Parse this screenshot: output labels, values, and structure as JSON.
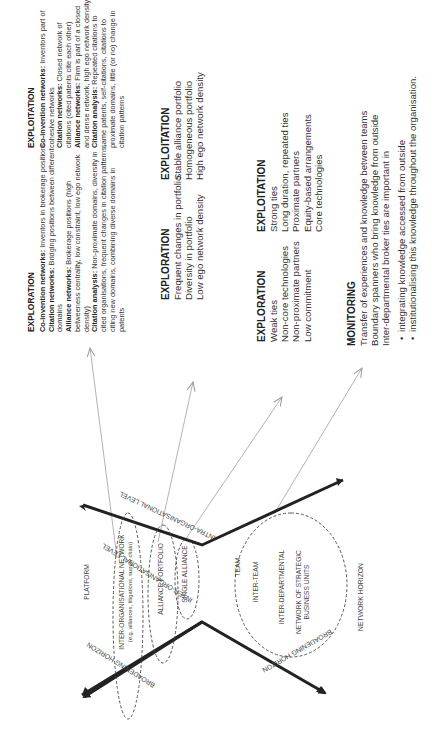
{
  "exploration_detailed": {
    "heading": "EXPLORATION",
    "items": [
      {
        "term": "Co-invention networks:",
        "text": " Inventors in brokerage positions"
      },
      {
        "term": "Citation networks:",
        "text": " Bridging positions between different domains"
      },
      {
        "term": "Alliance networks:",
        "text": " Brokerage positions (high betweeness centrality, low constraint, low ego network density)"
      },
      {
        "term": "Citation analysis:",
        "text": " Non-proximate domains, diversity in cited organisations, frequent changes in citation patterns, citing new domains, combining diverse domains in patents"
      }
    ]
  },
  "exploitation_detailed": {
    "heading": "EXPLOITATION",
    "items": [
      {
        "term": "Co-invention networks:",
        "text": " Inventors part of cohesive networks"
      },
      {
        "term": "Citation networks:",
        "text": " Closed network of citations (cited patents cite each other)"
      },
      {
        "term": "Alliance networks:",
        "text": " Firm is part of a closed and dense network, high ego network density"
      },
      {
        "term": "Citation analysis:",
        "text": " Repeated citations to same patents, self-citations, citations to proximate domains, little (or no) change in citation patterns"
      }
    ]
  },
  "exploration_portfolio": {
    "heading": "EXPLORATION",
    "lines": [
      "Frequent changes in portfolio",
      "Diversity in portfolio",
      "Low ego network density"
    ]
  },
  "exploitation_portfolio": {
    "heading": "EXPLOITATION",
    "lines": [
      "Stable alliance portfolio",
      "Homogeneous portfolio",
      "High ego network density"
    ]
  },
  "exploration_ties": {
    "heading": "EXPLORATION",
    "lines": [
      "Weak ties",
      "Non-core technologies",
      "Non-proximate partners",
      "Low commitment"
    ]
  },
  "exploitation_ties": {
    "heading": "EXPLOITATION",
    "lines": [
      "Strong ties",
      "Long duration, repeated ties",
      "Proximate partners",
      "Equity-based arrangements",
      "Core technologies"
    ]
  },
  "monitoring": {
    "heading": "MONITORING",
    "lines": [
      "Transfer of experiences and knowledge between teams",
      "Boundary spanners who bring knowledge from outside",
      "Inter-departmental broker ties are important in"
    ],
    "bullets": [
      "integrating knowledge accessed from  outside",
      "institutionalising this knowledge throughout the organisation."
    ]
  },
  "axes": {
    "inter_org_level": "INTER-ORGANISATIONAL LEVEL",
    "intra_org_level": "INTRA-ORGANISATIONAL LEVEL",
    "broadening_horizon_left": "BROADENING HORIZON",
    "broadening_horizon_right": "BROADENING HORIZON"
  },
  "left_ellipses": {
    "platform": "PLATFORM",
    "inter_org_network": "INTER-ORGANISATIONAL NETWORK",
    "inter_org_network_sub": "(e.g. alliances, litigations, supply chain)",
    "alliance_portfolio": "ALLIANCE PORTFOLIO",
    "single_alliance": "SINGLE ALLIANCE"
  },
  "right_ellipse": {
    "team": "TEAM",
    "inter_team": "INTER-TEAM",
    "inter_departmental": "INTER-DEPARTMENTAL",
    "network_sbu_line1": "NETWORK OF STRATEGIC",
    "network_sbu_line2": "BUSINESS UNITS"
  },
  "network_horizon": "NETWORK HORIZON",
  "colors": {
    "axis": "#222222",
    "thin_arrow": "#999999",
    "dashed": "#444444",
    "text": "#333333"
  }
}
